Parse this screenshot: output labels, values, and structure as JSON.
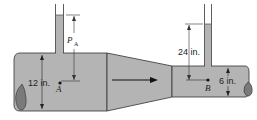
{
  "diagram": {
    "type": "venturi-meter-piezometers",
    "labels": {
      "pressure_head_A": "P",
      "pressure_head_A_sub": "A",
      "height_diff": "24 in.",
      "diameter_large": "12 in.",
      "diameter_small": "6 in.",
      "point_A": "A",
      "point_B": "B"
    },
    "colors": {
      "fluid": "#b4b4b4",
      "outline": "#333333",
      "pipe_end": "#7a7a7a"
    },
    "flow_direction": "left-to-right"
  }
}
